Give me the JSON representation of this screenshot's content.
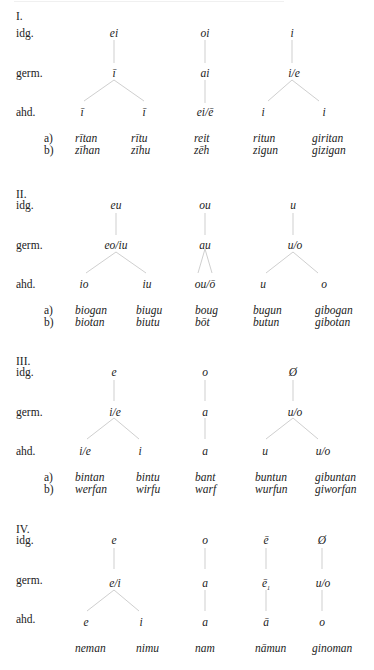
{
  "row_labels": {
    "idg": "idg.",
    "germ": "germ.",
    "ahd": "ahd.",
    "a": "a)",
    "b": "b)"
  },
  "sections": [
    {
      "numeral": "I.",
      "idg": [
        "ei",
        "oi",
        "i"
      ],
      "germ": [
        "ī",
        "ai",
        "i/e"
      ],
      "ahd": [
        "ī",
        "ī",
        "ei/ē",
        "i",
        "i"
      ],
      "examples_a": [
        "rītan",
        "rītu",
        "reit",
        "ritun",
        "giritan"
      ],
      "examples_b": [
        "zīhan",
        "zīhu",
        "zēh",
        "zigun",
        "gizigan"
      ]
    },
    {
      "numeral": "II.",
      "idg": [
        "eu",
        "ou",
        "u"
      ],
      "germ": [
        "eo/iu",
        "au",
        "u/o"
      ],
      "ahd": [
        "io",
        "iu",
        "ou/ō",
        "u",
        "o"
      ],
      "examples_a": [
        "biogan",
        "biugu",
        "boug",
        "bugun",
        "gibogan"
      ],
      "examples_b": [
        "biotan",
        "biutu",
        "bōt",
        "butun",
        "gibotan"
      ]
    },
    {
      "numeral": "III.",
      "idg": [
        "e",
        "o",
        "Ø"
      ],
      "germ": [
        "i/e",
        "a",
        "u/o"
      ],
      "ahd": [
        "i/e",
        "i",
        "a",
        "u",
        "u/o"
      ],
      "examples_a": [
        "bintan",
        "bintu",
        "bant",
        "buntun",
        "gibuntan"
      ],
      "examples_b": [
        "werfan",
        "wirfu",
        "warf",
        "wurfun",
        "giworfan"
      ]
    },
    {
      "numeral": "IV.",
      "idg": [
        "e",
        "o",
        "ē",
        "Ø"
      ],
      "germ": [
        "e/i",
        "a",
        "ē",
        "u/o"
      ],
      "germ_subscript": "1",
      "ahd": [
        "e",
        "i",
        "a",
        "ā",
        "o"
      ],
      "examples": [
        "neman",
        "nimu",
        "nam",
        "nāmun",
        "ginoman"
      ]
    }
  ]
}
